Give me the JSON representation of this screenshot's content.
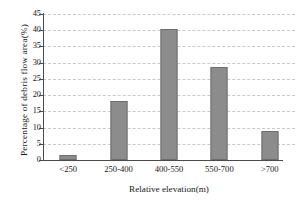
{
  "chart_data": {
    "type": "bar",
    "title": "",
    "xlabel": "Relative elevation(m)",
    "ylabel": "Percentage of debris flow area(%)",
    "categories": [
      "<250",
      "250-400",
      "400-550",
      "550-700",
      ">700"
    ],
    "values": [
      1.5,
      18.2,
      40.5,
      28.8,
      8.8
    ],
    "ylim": [
      0,
      45
    ],
    "yticks": [
      0,
      5,
      10,
      15,
      20,
      25,
      30,
      35,
      40,
      45
    ],
    "ytick_labels": [
      "0",
      "5",
      "10",
      "15",
      "20",
      "25",
      "30",
      "35",
      "40",
      "45"
    ],
    "grid": "horizontal-dashed",
    "legend": "none",
    "series": [
      {
        "name": "Percentage of debris flow area",
        "color": "#8c8c8c",
        "values": [
          1.5,
          18.2,
          40.5,
          28.8,
          8.8
        ]
      }
    ]
  }
}
